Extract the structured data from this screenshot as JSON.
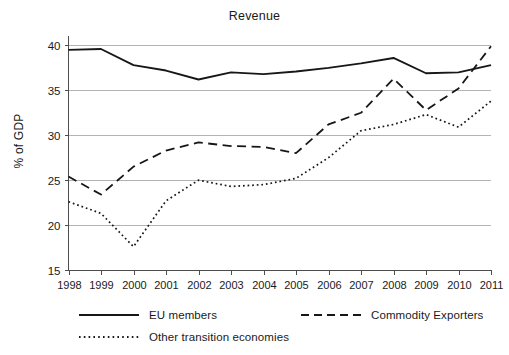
{
  "chart_data": {
    "type": "line",
    "title": "Revenue",
    "xlabel": "",
    "ylabel": "% of GDP",
    "x": [
      1998,
      1999,
      2000,
      2001,
      2002,
      2003,
      2004,
      2005,
      2006,
      2007,
      2008,
      2009,
      2010,
      2011
    ],
    "xtick_labels": [
      "1998",
      "1999",
      "2000",
      "2001",
      "2002",
      "2003",
      "2004",
      "2005",
      "2006",
      "2007",
      "2008",
      "2009",
      "2010",
      "2011"
    ],
    "ytick_labels": [
      "15",
      "20",
      "25",
      "30",
      "35",
      "40"
    ],
    "yticks": [
      15,
      20,
      25,
      30,
      35,
      40
    ],
    "ylim": [
      15,
      40.6
    ],
    "xlim": [
      1998,
      2011
    ],
    "grid": "horizontal",
    "legend_position": "below-axes",
    "line_color": "#171717",
    "grid_color": "#b4b4b4",
    "axis_color": "#4d4d4d",
    "series": [
      {
        "name": "EU members",
        "style": "solid",
        "values": [
          39.5,
          39.6,
          37.8,
          37.2,
          36.2,
          37.0,
          36.8,
          37.1,
          37.5,
          38.0,
          38.6,
          36.9,
          37.0,
          37.8
        ]
      },
      {
        "name": "Commodity Exporters",
        "style": "dashed",
        "values": [
          25.4,
          23.4,
          26.5,
          28.3,
          29.2,
          28.8,
          28.7,
          28.0,
          31.2,
          32.5,
          36.3,
          32.8,
          35.2,
          39.9
        ]
      },
      {
        "name": "Other transition economies",
        "style": "dotted",
        "values": [
          22.6,
          21.3,
          17.6,
          22.7,
          25.0,
          24.3,
          24.5,
          25.2,
          27.5,
          30.5,
          31.2,
          32.3,
          30.9,
          33.8
        ]
      }
    ]
  },
  "legend": {
    "items": [
      {
        "label": "EU members",
        "style": "solid"
      },
      {
        "label": "Commodity Exporters",
        "style": "dashed"
      },
      {
        "label": "Other transition economies",
        "style": "dotted"
      }
    ]
  }
}
